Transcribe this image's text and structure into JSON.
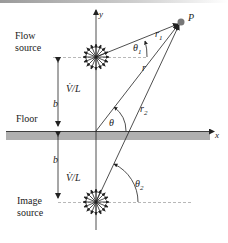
{
  "diagram": {
    "labels": {
      "flow_source": [
        "Flow",
        "source"
      ],
      "image_source": [
        "Image",
        "source"
      ],
      "floor": "Floor",
      "point": "P",
      "x_axis": "x",
      "y_axis": "y",
      "r1": "r",
      "r1_sub": "1",
      "r": "r",
      "r2": "r",
      "r2_sub": "2",
      "theta": "θ",
      "theta1": "θ",
      "theta1_sub": "1",
      "theta2": "θ",
      "theta2_sub": "2",
      "b_upper": "b",
      "b_lower": "b",
      "strength_upper": "V̇/L",
      "strength_lower": "V̇/L"
    },
    "colors": {
      "floor": "#b0b0b0",
      "line": "#222222",
      "dashed": "#999999",
      "point": "#777777"
    }
  }
}
